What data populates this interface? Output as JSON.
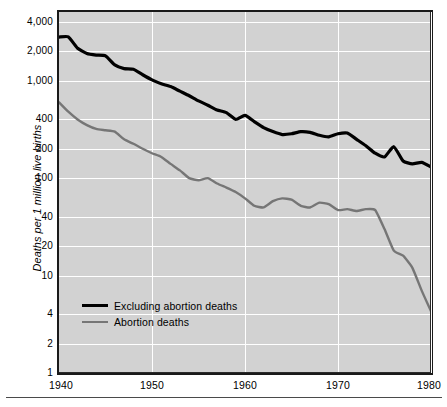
{
  "chart_data": {
    "type": "line",
    "title": "",
    "subtitle": "",
    "xlabel": "",
    "ylabel": "Deaths per 1 million live births",
    "yscale": "log",
    "ylim": [
      1,
      4000
    ],
    "xlim": [
      1940,
      1980
    ],
    "grid": true,
    "legend_position": "inside-lower-left",
    "ytick_labels": [
      "4,000",
      "2,000",
      "1,000",
      "400",
      "200",
      "100",
      "40",
      "20",
      "10",
      "4",
      "2",
      "1"
    ],
    "ytick_values": [
      4000,
      2000,
      1000,
      400,
      200,
      100,
      40,
      20,
      10,
      4,
      2,
      1
    ],
    "xtick_labels": [
      "1940",
      "1950",
      "1960",
      "1970",
      "1980"
    ],
    "xtick_values": [
      1940,
      1950,
      1960,
      1970,
      1980
    ],
    "colors": {
      "excluding_abortion_deaths": "#000000",
      "abortion_deaths": "#767676",
      "plot_background": "#d2d2d2",
      "gridline": "#ffffff",
      "frame": "#1a1a1a"
    },
    "x": [
      1940,
      1941,
      1942,
      1943,
      1944,
      1945,
      1946,
      1947,
      1948,
      1949,
      1950,
      1951,
      1952,
      1953,
      1954,
      1955,
      1956,
      1957,
      1958,
      1959,
      1960,
      1961,
      1962,
      1963,
      1964,
      1965,
      1966,
      1967,
      1968,
      1969,
      1970,
      1971,
      1972,
      1973,
      1974,
      1975,
      1976,
      1977,
      1978,
      1979,
      1980
    ],
    "series": [
      {
        "name": "Excluding abortion deaths",
        "color": "#000000",
        "values": [
          2800,
          2820,
          2150,
          1900,
          1830,
          1800,
          1450,
          1330,
          1310,
          1150,
          1020,
          930,
          870,
          780,
          700,
          620,
          560,
          500,
          470,
          400,
          440,
          380,
          330,
          300,
          280,
          285,
          300,
          295,
          275,
          265,
          285,
          290,
          250,
          215,
          180,
          165,
          210,
          150,
          140,
          145,
          130
        ]
      },
      {
        "name": "Abortion deaths",
        "color": "#767676",
        "values": [
          600,
          480,
          400,
          350,
          320,
          310,
          300,
          250,
          225,
          200,
          180,
          165,
          140,
          120,
          100,
          95,
          100,
          88,
          80,
          72,
          62,
          52,
          50,
          58,
          62,
          60,
          52,
          50,
          56,
          54,
          47,
          48,
          46,
          48,
          47,
          30,
          18,
          16,
          12,
          7,
          4.3
        ]
      }
    ]
  },
  "axes": {
    "y_title": "Deaths per 1 million live births"
  },
  "legend": {
    "items": [
      {
        "label": "Excluding abortion deaths",
        "style": "black"
      },
      {
        "label": "Abortion deaths",
        "style": "gray"
      }
    ]
  }
}
